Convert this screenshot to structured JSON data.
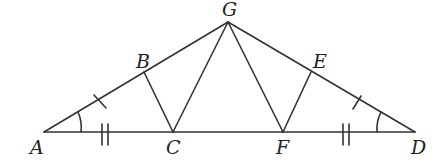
{
  "diagram": {
    "type": "geometry",
    "stroke_color": "#333333",
    "points": {
      "A": {
        "label": "A",
        "x": 44,
        "y": 132
      },
      "B": {
        "label": "B",
        "x": 144,
        "y": 72
      },
      "C": {
        "label": "C",
        "x": 173,
        "y": 132
      },
      "D": {
        "label": "D",
        "x": 415,
        "y": 132
      },
      "E": {
        "label": "E",
        "x": 311,
        "y": 72
      },
      "F": {
        "label": "F",
        "x": 283,
        "y": 132
      },
      "G": {
        "label": "G",
        "x": 228,
        "y": 22
      }
    },
    "segments": [
      "AD",
      "AG",
      "GD",
      "BC",
      "GC",
      "GF",
      "EF"
    ],
    "marks": {
      "single_tick": [
        "AB",
        "ED"
      ],
      "double_tick": [
        "AC",
        "FD"
      ],
      "angle_arc": [
        "A",
        "D"
      ]
    }
  }
}
